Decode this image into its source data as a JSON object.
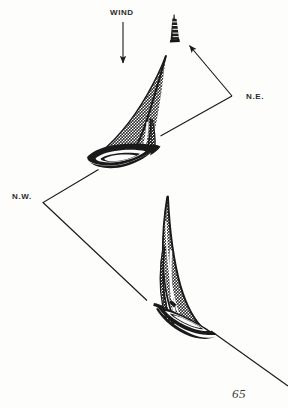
{
  "figure": {
    "caption_labels": {
      "wind": "WIND",
      "northeast": "N.E.",
      "northwest": "N.W."
    },
    "page_number": "65",
    "colors": {
      "ink": "#1a1a1a",
      "sail_halftone": "#8a8a8a",
      "sail_halftone_dark": "#6e6e6e",
      "background": "#fdfdfc",
      "label_text": "#2b2b2b",
      "page_number_text": "#3a3a3a"
    },
    "elements": [
      {
        "name": "wind-arrow",
        "type": "arrow",
        "description": "Vertical downward arrow indicating wind direction",
        "from": [
          123,
          22
        ],
        "to": [
          123,
          68
        ]
      },
      {
        "name": "distant-boat",
        "type": "silhouette",
        "description": "Small dark sailboat silhouette seen end-on in the distance",
        "position": [
          174,
          30
        ]
      },
      {
        "name": "northeast-arrow",
        "type": "bent-arrow",
        "description": "Bent leader line from N.E. label with arrowhead pointing at the distant boat",
        "points": [
          [
            160,
            136
          ],
          [
            232,
            96
          ],
          [
            188,
            44
          ]
        ]
      },
      {
        "name": "northwest-arrow",
        "type": "bent-arrow",
        "description": "Bent leader line from N.W. label to the two heeling sailboats",
        "points": [
          [
            98,
            170
          ],
          [
            43,
            202
          ],
          [
            147,
            300
          ]
        ]
      },
      {
        "name": "heading-line",
        "type": "line",
        "description": "Diagonal course line running off the lower right corner",
        "from": [
          213,
          333
        ],
        "to": [
          288,
          386
        ]
      },
      {
        "name": "upper-sailboat",
        "type": "sailboat",
        "description": "Sailboat heeled hard over to the left, bow toward lower left, mast tip upper right",
        "mast_tip": [
          166,
          56
        ],
        "hull": [
          120,
          155
        ]
      },
      {
        "name": "lower-sailboat",
        "type": "sailboat",
        "description": "Sailboat heeled over with mast curving right, hull at lower right",
        "mast_tip": [
          168,
          197
        ],
        "hull": [
          190,
          320
        ]
      }
    ]
  }
}
